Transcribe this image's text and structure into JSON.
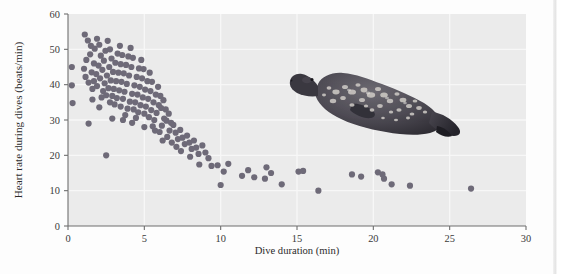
{
  "figure": {
    "background_color": "#fdfdfd",
    "plot_background_color": "#ebebeb",
    "grid_color": "#f7f7f7",
    "axis_color": "#6f6f6f",
    "point_color": "#6e6a78",
    "point_radius": 3.1
  },
  "chart_data": {
    "type": "scatter",
    "title": "",
    "xlabel": "Dive duration (min)",
    "ylabel": "Heart rate during dives (beats/min)",
    "xlim": [
      0,
      30
    ],
    "ylim": [
      0,
      60
    ],
    "xticks": [
      0,
      5,
      10,
      15,
      20,
      25,
      30
    ],
    "yticks": [
      0,
      10,
      20,
      30,
      40,
      50,
      60
    ],
    "xtick_labels": [
      "0",
      "5",
      "10",
      "15",
      "20",
      "25",
      "30"
    ],
    "ytick_labels": [
      "0",
      "10",
      "20",
      "30",
      "40",
      "50",
      "60"
    ],
    "grid": true,
    "legend": "none",
    "series": [
      {
        "name": "Weddell seal dives",
        "marker": "circle",
        "color": "#6e6a78",
        "points": [
          [
            0.25,
            45.0
          ],
          [
            0.25,
            39.8
          ],
          [
            0.3,
            34.8
          ],
          [
            1.35,
            29.0
          ],
          [
            2.5,
            20.0
          ],
          [
            1.1,
            54.2
          ],
          [
            1.3,
            52.5
          ],
          [
            1.5,
            51.0
          ],
          [
            1.45,
            48.6
          ],
          [
            1.2,
            47.0
          ],
          [
            1.05,
            44.5
          ],
          [
            1.15,
            42.2
          ],
          [
            1.35,
            40.6
          ],
          [
            1.55,
            43.5
          ],
          [
            1.7,
            46.0
          ],
          [
            1.75,
            50.2
          ],
          [
            1.9,
            53.0
          ],
          [
            2.05,
            51.3
          ],
          [
            2.15,
            48.2
          ],
          [
            2.0,
            45.4
          ],
          [
            1.85,
            43.0
          ],
          [
            1.7,
            41.0
          ],
          [
            1.6,
            38.8
          ],
          [
            1.9,
            39.6
          ],
          [
            2.1,
            41.8
          ],
          [
            2.25,
            44.2
          ],
          [
            2.35,
            46.8
          ],
          [
            2.45,
            49.6
          ],
          [
            2.6,
            52.4
          ],
          [
            2.75,
            50.0
          ],
          [
            2.85,
            47.4
          ],
          [
            2.7,
            45.0
          ],
          [
            2.55,
            42.6
          ],
          [
            2.4,
            40.4
          ],
          [
            2.3,
            38.2
          ],
          [
            2.2,
            36.4
          ],
          [
            2.5,
            37.0
          ],
          [
            2.65,
            39.0
          ],
          [
            2.8,
            41.2
          ],
          [
            2.95,
            43.6
          ],
          [
            3.1,
            46.2
          ],
          [
            3.25,
            48.8
          ],
          [
            3.4,
            51.0
          ],
          [
            3.55,
            48.4
          ],
          [
            3.45,
            45.8
          ],
          [
            3.3,
            43.4
          ],
          [
            3.15,
            41.0
          ],
          [
            3.0,
            38.8
          ],
          [
            2.9,
            36.8
          ],
          [
            2.75,
            35.0
          ],
          [
            3.05,
            34.4
          ],
          [
            3.2,
            36.2
          ],
          [
            3.35,
            38.4
          ],
          [
            3.5,
            40.8
          ],
          [
            3.65,
            43.2
          ],
          [
            3.8,
            45.6
          ],
          [
            3.95,
            48.0
          ],
          [
            4.1,
            50.4
          ],
          [
            4.25,
            47.6
          ],
          [
            4.15,
            45.0
          ],
          [
            4.0,
            42.6
          ],
          [
            3.85,
            40.2
          ],
          [
            3.7,
            38.0
          ],
          [
            3.6,
            36.0
          ],
          [
            3.45,
            33.8
          ],
          [
            3.9,
            33.2
          ],
          [
            4.05,
            35.2
          ],
          [
            4.2,
            37.4
          ],
          [
            4.35,
            39.8
          ],
          [
            4.5,
            42.2
          ],
          [
            4.65,
            44.6
          ],
          [
            4.8,
            47.0
          ],
          [
            4.95,
            44.4
          ],
          [
            4.85,
            41.8
          ],
          [
            4.7,
            39.4
          ],
          [
            4.55,
            37.2
          ],
          [
            4.4,
            35.0
          ],
          [
            4.3,
            33.0
          ],
          [
            4.6,
            32.2
          ],
          [
            4.75,
            34.2
          ],
          [
            4.9,
            36.4
          ],
          [
            5.05,
            38.6
          ],
          [
            5.2,
            41.0
          ],
          [
            5.35,
            43.4
          ],
          [
            5.5,
            40.8
          ],
          [
            5.4,
            38.2
          ],
          [
            5.25,
            36.0
          ],
          [
            5.1,
            33.8
          ],
          [
            5.0,
            31.8
          ],
          [
            5.3,
            30.8
          ],
          [
            5.45,
            32.8
          ],
          [
            5.6,
            35.0
          ],
          [
            5.75,
            37.2
          ],
          [
            5.9,
            39.4
          ],
          [
            6.05,
            36.8
          ],
          [
            5.95,
            34.2
          ],
          [
            5.8,
            32.0
          ],
          [
            5.65,
            30.0
          ],
          [
            5.55,
            28.2
          ],
          [
            6.1,
            33.4
          ],
          [
            6.25,
            35.6
          ],
          [
            6.4,
            33.0
          ],
          [
            6.3,
            30.4
          ],
          [
            6.15,
            28.4
          ],
          [
            6.0,
            26.6
          ],
          [
            6.45,
            29.8
          ],
          [
            6.6,
            31.8
          ],
          [
            6.75,
            29.2
          ],
          [
            6.65,
            27.0
          ],
          [
            6.5,
            25.2
          ],
          [
            6.9,
            28.6
          ],
          [
            7.05,
            26.4
          ],
          [
            7.2,
            24.6
          ],
          [
            7.35,
            27.2
          ],
          [
            7.5,
            25.0
          ],
          [
            7.65,
            23.2
          ],
          [
            7.8,
            25.6
          ],
          [
            7.95,
            23.6
          ],
          [
            8.1,
            21.8
          ],
          [
            8.25,
            24.2
          ],
          [
            8.4,
            22.2
          ],
          [
            8.55,
            20.4
          ],
          [
            8.8,
            22.8
          ],
          [
            9.0,
            20.8
          ],
          [
            9.2,
            19.2
          ],
          [
            2.9,
            30.4
          ],
          [
            3.6,
            30.0
          ],
          [
            4.2,
            29.2
          ],
          [
            5.0,
            28.0
          ],
          [
            6.8,
            23.6
          ],
          [
            7.4,
            21.2
          ],
          [
            8.0,
            19.6
          ],
          [
            1.6,
            35.8
          ],
          [
            2.05,
            33.6
          ],
          [
            3.75,
            31.4
          ],
          [
            4.45,
            30.6
          ],
          [
            5.7,
            27.0
          ],
          [
            6.2,
            24.2
          ],
          [
            7.1,
            22.4
          ],
          [
            8.6,
            17.4
          ],
          [
            9.4,
            17.0
          ],
          [
            10.2,
            15.4
          ],
          [
            10.5,
            17.6
          ],
          [
            11.4,
            14.2
          ],
          [
            11.8,
            15.8
          ],
          [
            12.9,
            13.4
          ],
          [
            13.0,
            16.6
          ],
          [
            13.3,
            15.0
          ],
          [
            14.0,
            11.8
          ],
          [
            15.1,
            15.4
          ],
          [
            15.4,
            15.6
          ],
          [
            16.4,
            10.0
          ],
          [
            18.6,
            14.6
          ],
          [
            19.2,
            14.0
          ],
          [
            20.3,
            15.2
          ],
          [
            20.6,
            14.6
          ],
          [
            20.7,
            13.4
          ],
          [
            21.2,
            11.8
          ],
          [
            22.4,
            11.4
          ],
          [
            26.4,
            10.6
          ],
          [
            9.8,
            17.2
          ],
          [
            10.0,
            11.6
          ],
          [
            12.2,
            13.8
          ]
        ]
      }
    ]
  },
  "illustration": {
    "name": "weddell-seal",
    "description": "Spotted seal illustration"
  }
}
